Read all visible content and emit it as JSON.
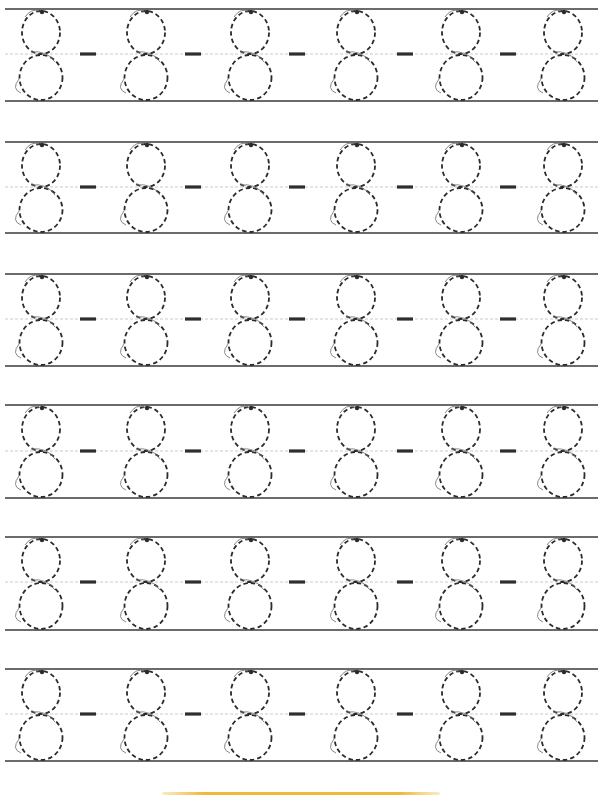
{
  "worksheet": {
    "title": "Number 8 tracing practice",
    "digit": "8",
    "separator": "-",
    "rows": [
      {
        "top": 9,
        "mid": 54,
        "bottom": 101
      },
      {
        "top": 142,
        "mid": 187,
        "bottom": 233
      },
      {
        "top": 274,
        "mid": 319,
        "bottom": 366
      },
      {
        "top": 405,
        "mid": 451,
        "bottom": 498
      },
      {
        "top": 537,
        "mid": 582,
        "bottom": 630
      },
      {
        "top": 669,
        "mid": 714,
        "bottom": 761
      }
    ],
    "digit_centers_x": [
      41,
      146,
      250,
      356,
      461,
      563
    ],
    "dash_centers_x": [
      88,
      193,
      297,
      405,
      508
    ],
    "digits_per_row": 6,
    "dashes_per_row": 5,
    "line_x_start": 5,
    "line_x_end": 598
  },
  "colors": {
    "ruling_line": "#3a3a3a",
    "midline": "#bdbdbd",
    "trace_stroke": "#2b2b2b",
    "guide_arrow": "#7a7a7a",
    "dash": "#2e2e2e",
    "footer_accent": "#f0b93c"
  }
}
